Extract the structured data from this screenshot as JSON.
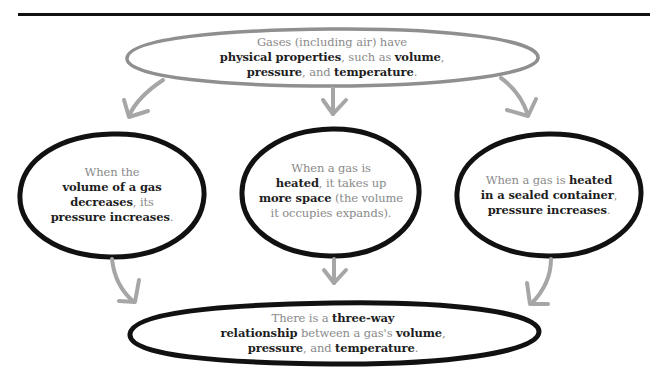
{
  "diagram": {
    "type": "concept-flow",
    "colors": {
      "top_node_outline": "#8f8f8f",
      "node_outline": "#111111",
      "arrow": "#a6a6a6",
      "regular_text": "#8a8a8a",
      "bold_text": "#1e1e1e",
      "rule": "#111111"
    },
    "top_node": {
      "lines": [
        [
          {
            "t": "Gases (including air) have",
            "b": false
          }
        ],
        [
          {
            "t": "physical properties",
            "b": true
          },
          {
            "t": ", such as ",
            "b": false
          },
          {
            "t": "volume",
            "b": true
          },
          {
            "t": ",",
            "b": false
          }
        ],
        [
          {
            "t": "pressure",
            "b": true
          },
          {
            "t": ", and ",
            "b": false
          },
          {
            "t": "temperature",
            "b": true
          },
          {
            "t": ".",
            "b": false
          }
        ]
      ]
    },
    "middle_nodes": [
      {
        "id": "volume-pressure",
        "lines": [
          [
            {
              "t": "When the",
              "b": false
            }
          ],
          [
            {
              "t": "volume of a gas",
              "b": true
            }
          ],
          [
            {
              "t": "decreases",
              "b": true
            },
            {
              "t": ", its",
              "b": false
            }
          ],
          [
            {
              "t": "pressure increases",
              "b": true
            },
            {
              "t": ".",
              "b": false
            }
          ]
        ]
      },
      {
        "id": "heat-volume",
        "lines": [
          [
            {
              "t": "When a gas is",
              "b": false
            }
          ],
          [
            {
              "t": "heated",
              "b": true
            },
            {
              "t": ", it takes up",
              "b": false
            }
          ],
          [
            {
              "t": "more space",
              "b": true
            },
            {
              "t": " (the volume",
              "b": false
            }
          ],
          [
            {
              "t": "it occupies expands).",
              "b": false
            }
          ]
        ]
      },
      {
        "id": "heat-pressure",
        "lines": [
          [
            {
              "t": "When a gas is ",
              "b": false
            },
            {
              "t": "heated",
              "b": true
            }
          ],
          [
            {
              "t": "in a sealed container",
              "b": true
            },
            {
              "t": ",",
              "b": false
            }
          ],
          [
            {
              "t": "pressure increases",
              "b": true
            },
            {
              "t": ".",
              "b": false
            }
          ]
        ]
      }
    ],
    "bottom_node": {
      "lines": [
        [
          {
            "t": "There is a ",
            "b": false
          },
          {
            "t": "three-way",
            "b": true
          }
        ],
        [
          {
            "t": "relationship",
            "b": true
          },
          {
            "t": " between a gas's ",
            "b": false
          },
          {
            "t": "volume",
            "b": true
          },
          {
            "t": ",",
            "b": false
          }
        ],
        [
          {
            "t": "pressure",
            "b": true
          },
          {
            "t": ", and ",
            "b": false
          },
          {
            "t": "temperature",
            "b": true
          },
          {
            "t": ".",
            "b": false
          }
        ]
      ]
    },
    "edges": [
      {
        "from": "top_node",
        "to": "volume-pressure"
      },
      {
        "from": "top_node",
        "to": "heat-volume"
      },
      {
        "from": "top_node",
        "to": "heat-pressure"
      },
      {
        "from": "volume-pressure",
        "to": "bottom_node"
      },
      {
        "from": "heat-volume",
        "to": "bottom_node"
      },
      {
        "from": "heat-pressure",
        "to": "bottom_node"
      }
    ]
  }
}
